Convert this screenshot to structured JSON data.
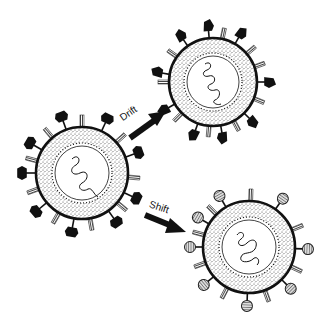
{
  "diagram": {
    "nodes": [
      {
        "id": "original",
        "label": "",
        "surface_proteins": "black hexagonal spikes + striped stalks"
      },
      {
        "id": "drift",
        "label": "",
        "surface_proteins": "slightly altered black spikes + striped stalks"
      },
      {
        "id": "shift",
        "label": "",
        "surface_proteins": "new hatched round spikes + striped stalks"
      }
    ],
    "edges": [
      {
        "from": "original",
        "to": "drift",
        "label": "Drift"
      },
      {
        "from": "original",
        "to": "shift",
        "label": "Shift"
      }
    ],
    "colors": {
      "ink": "#111111",
      "background": "#ffffff",
      "stipple": "#555555",
      "hatched": "#888888"
    }
  }
}
